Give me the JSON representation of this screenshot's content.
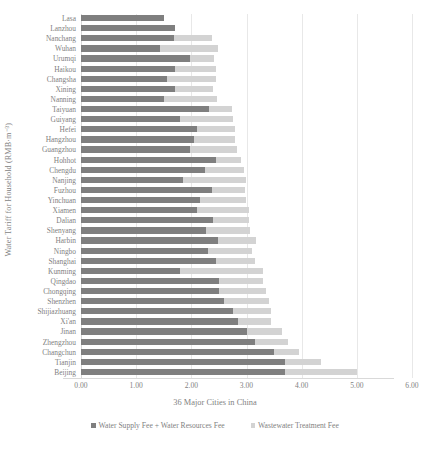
{
  "chart_data": {
    "type": "bar",
    "orientation": "horizontal",
    "stacked": true,
    "title": "",
    "xlabel": "36 Major Cities in China",
    "ylabel": "Water Tariff for Household (RMB·m⁻³)",
    "xlim": [
      0.0,
      6.0
    ],
    "xticks": [
      0.0,
      1.0,
      2.0,
      3.0,
      4.0,
      5.0,
      6.0
    ],
    "xtick_labels": [
      "0.00",
      "1.00",
      "2.00",
      "3.00",
      "4.00",
      "5.00",
      "6.00"
    ],
    "grid": true,
    "legend_position": "bottom",
    "categories": [
      "Lasa",
      "Lanzhou",
      "Nanchang",
      "Wuhan",
      "Urumqi",
      "Haikou",
      "Changsha",
      "Xining",
      "Nanning",
      "Taiyuan",
      "Guiyang",
      "Hefei",
      "Hangzhou",
      "Guangzhou",
      "Hohhot",
      "Chengdu",
      "Nanjing",
      "Fuzhou",
      "Yinchuan",
      "Xiamen",
      "Dalian",
      "Shenyang",
      "Harbin",
      "Ningbo",
      "Shanghai",
      "Kunming",
      "Qingdao",
      "Chongqing",
      "Shenzhen",
      "Shijiazhuang",
      "Xi'an",
      "Jinan",
      "Zhengzhou",
      "Changchun",
      "Tianjin",
      "Beijing"
    ],
    "series": [
      {
        "name": "Water Supply Fee + Water Resources Fee",
        "color": "#7f7f7f",
        "values": [
          1.5,
          1.7,
          1.68,
          1.44,
          1.97,
          1.7,
          1.55,
          1.7,
          1.51,
          2.32,
          1.8,
          2.1,
          2.05,
          1.98,
          2.45,
          2.25,
          1.85,
          2.37,
          2.15,
          2.1,
          2.4,
          2.27,
          2.48,
          2.3,
          2.45,
          1.8,
          2.5,
          2.5,
          2.6,
          2.75,
          2.85,
          3.0,
          3.15,
          3.5,
          3.7,
          3.7
        ]
      },
      {
        "name": "Wastewater Treatment Fee",
        "color": "#d3d3d3",
        "values": [
          0.0,
          0.0,
          0.7,
          1.04,
          0.45,
          0.75,
          0.9,
          0.7,
          0.95,
          0.42,
          0.95,
          0.7,
          0.75,
          0.85,
          0.45,
          0.7,
          1.15,
          0.6,
          0.85,
          0.95,
          0.65,
          0.8,
          0.7,
          0.8,
          0.7,
          1.5,
          0.8,
          0.85,
          0.8,
          0.7,
          0.6,
          0.65,
          0.6,
          0.45,
          0.65,
          1.3
        ]
      }
    ]
  },
  "legend": {
    "items": [
      {
        "label": "Water Supply Fee + Water Resources Fee",
        "color": "#7f7f7f"
      },
      {
        "label": "Wastewater Treatment Fee",
        "color": "#d3d3d3"
      }
    ]
  }
}
